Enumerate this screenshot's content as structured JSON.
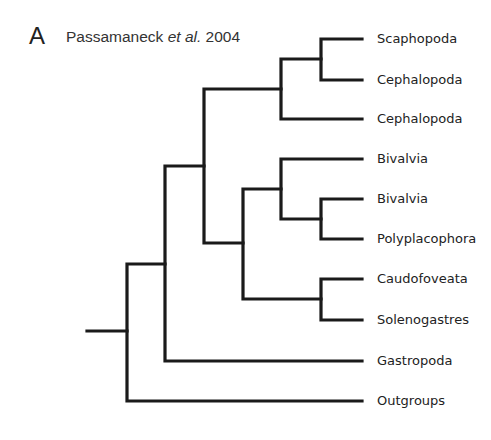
{
  "figure": {
    "panel_letter": "A",
    "citation": {
      "author": "Passamaneck",
      "etal": "et al.",
      "year": "2004"
    }
  },
  "tree": {
    "leaves": [
      {
        "label": "Scaphopoda",
        "y": 39
      },
      {
        "label": "Cephalopoda",
        "y": 80
      },
      {
        "label": "Cephalopoda",
        "y": 119
      },
      {
        "label": "Bivalvia",
        "y": 159
      },
      {
        "label": "Bivalvia",
        "y": 199
      },
      {
        "label": "Polyplacophora",
        "y": 239
      },
      {
        "label": "Caudofoveata",
        "y": 279
      },
      {
        "label": "Solenogastres",
        "y": 320
      },
      {
        "label": "Gastropoda",
        "y": 361
      },
      {
        "label": "Outgroups",
        "y": 401
      }
    ],
    "topology": "((((Scaphopoda,Cephalopoda),Cephalopoda),((Bivalvia,(Bivalvia,Polyplacophora)),(Caudofoveata,Solenogastres))),Gastropoda),Outgroups"
  }
}
